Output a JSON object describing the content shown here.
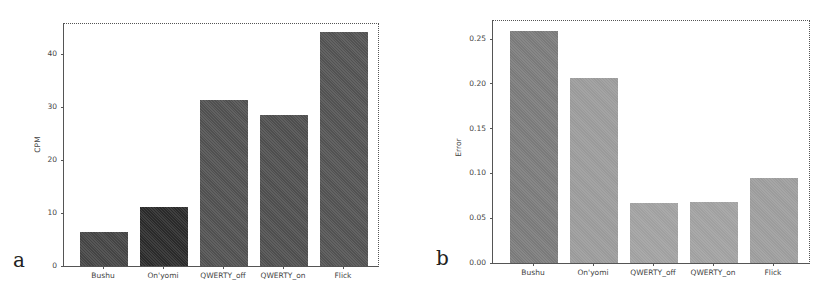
{
  "chart_data": [
    {
      "type": "bar",
      "panel_label": "a",
      "title": "",
      "xlabel": "",
      "ylabel": "CPM",
      "ylim": [
        0,
        46
      ],
      "yticks": [
        0,
        10,
        20,
        30,
        40
      ],
      "categories": [
        "Bushu",
        "On'yomi",
        "QWERTY_off",
        "QWERTY_on",
        "Flick"
      ],
      "values": [
        6.4,
        11.1,
        31.3,
        28.5,
        44.2
      ],
      "colors": [
        "#444444",
        "#2a2a2a",
        "#505050",
        "#4e4e4e",
        "#525252"
      ],
      "grid": false,
      "legend": null
    },
    {
      "type": "bar",
      "panel_label": "b",
      "title": "",
      "xlabel": "",
      "ylabel": "Error",
      "ylim": [
        0,
        0.27
      ],
      "yticks": [
        "0.00",
        "0.05",
        "0.10",
        "0.15",
        "0.20",
        "0.25"
      ],
      "categories": [
        "Bushu",
        "On'yomi",
        "QWERTY_off",
        "QWERTY_on",
        "Flick"
      ],
      "values": [
        0.259,
        0.206,
        0.067,
        0.068,
        0.095
      ],
      "colors": [
        "#7a7a7a",
        "#9a9a9a",
        "#a0a0a0",
        "#a0a0a0",
        "#9c9c9c"
      ],
      "grid": false,
      "legend": null
    }
  ]
}
